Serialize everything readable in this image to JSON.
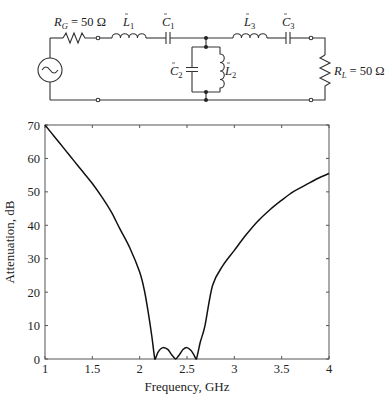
{
  "circuit": {
    "source_label": "",
    "labels": {
      "rg": {
        "main": "R",
        "sub": "G",
        "value": " = 50 Ω"
      },
      "l1": {
        "main": "L",
        "sub": "1"
      },
      "c1": {
        "main": "C",
        "sub": "1"
      },
      "l3": {
        "main": "L",
        "sub": "3"
      },
      "c3": {
        "main": "C",
        "sub": "3"
      },
      "c2": {
        "main": "C",
        "sub": "2"
      },
      "l2": {
        "main": "L",
        "sub": "2"
      },
      "rl": {
        "main": "R",
        "sub": "L",
        "value": " = 50 Ω"
      }
    }
  },
  "chart_data": {
    "type": "line",
    "title": "",
    "xlabel": "Frequency, GHz",
    "ylabel": "Attenuation, dB",
    "xlim": [
      1,
      4
    ],
    "ylim": [
      0,
      70
    ],
    "xticks": [
      1,
      1.5,
      2,
      2.5,
      3,
      3.5,
      4
    ],
    "xtick_labels": [
      "1",
      "1.5",
      "2",
      "2.5",
      "3",
      "3.5",
      "4"
    ],
    "yticks": [
      0,
      10,
      20,
      30,
      40,
      50,
      60,
      70
    ],
    "ytick_labels": [
      "0",
      "10",
      "20",
      "30",
      "40",
      "50",
      "60",
      "70"
    ],
    "grid": false,
    "legend": null,
    "series": [
      {
        "name": "Attenuation",
        "x": [
          1.0,
          1.1,
          1.2,
          1.3,
          1.4,
          1.5,
          1.6,
          1.7,
          1.79,
          1.9,
          2.0,
          2.05,
          2.09,
          2.13,
          2.16,
          2.19,
          2.22,
          2.26,
          2.3,
          2.34,
          2.38,
          2.42,
          2.46,
          2.5,
          2.54,
          2.57,
          2.6,
          2.64,
          2.69,
          2.77,
          2.88,
          3.0,
          3.12,
          3.24,
          3.37,
          3.5,
          3.62,
          3.75,
          3.88,
          4.0
        ],
        "values": [
          70,
          66.5,
          63,
          59.5,
          56,
          52.5,
          48.5,
          44,
          39,
          33,
          26,
          20.5,
          14,
          6.5,
          0,
          1.8,
          3.0,
          3.4,
          2.8,
          1.2,
          0,
          1.3,
          2.9,
          3.4,
          2.6,
          1.4,
          0,
          5,
          10,
          22,
          28,
          32.5,
          37,
          41,
          44.5,
          47.5,
          50,
          52,
          54,
          55.5
        ]
      }
    ]
  }
}
